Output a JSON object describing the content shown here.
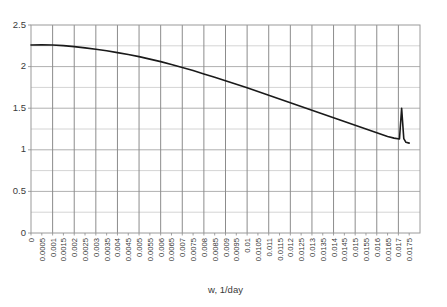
{
  "chart_data": {
    "type": "line",
    "title": "",
    "xlabel": "w, 1/day",
    "ylabel": "",
    "grid": true,
    "legend": "none",
    "xlim": [
      0,
      0.018
    ],
    "ylim": [
      0,
      2.5
    ],
    "y_ticks": [
      "0",
      "0.5",
      "1",
      "1.5",
      "2",
      "2.5"
    ],
    "y_tick_values": [
      0,
      0.5,
      1,
      1.5,
      2,
      2.5
    ],
    "x_ticks": [
      "0",
      "0.0005",
      "0.001",
      "0.0015",
      "0.002",
      "0.0025",
      "0.003",
      "0.0035",
      "0.004",
      "0.0045",
      "0.005",
      "0.0055",
      "0.006",
      "0.0065",
      "0.007",
      "0.0075",
      "0.008",
      "0.0085",
      "0.009",
      "0.0095",
      "0.01",
      "0.0105",
      "0.011",
      "0.0115",
      "0.012",
      "0.0125",
      "0.013",
      "0.0135",
      "0.014",
      "0.0145",
      "0.015",
      "0.0155",
      "0.016",
      "0.0165",
      "0.017",
      "0.0175"
    ],
    "x_tick_values": [
      0,
      0.0005,
      0.001,
      0.0015,
      0.002,
      0.0025,
      0.003,
      0.0035,
      0.004,
      0.0045,
      0.005,
      0.0055,
      0.006,
      0.0065,
      0.007,
      0.0075,
      0.008,
      0.0085,
      0.009,
      0.0095,
      0.01,
      0.0105,
      0.011,
      0.0115,
      0.012,
      0.0125,
      0.013,
      0.0135,
      0.014,
      0.0145,
      0.015,
      0.0155,
      0.016,
      0.0165,
      0.017,
      0.0175
    ],
    "gridline_x_values": [
      0,
      0.001,
      0.002,
      0.003,
      0.004,
      0.005,
      0.006,
      0.007,
      0.008,
      0.009,
      0.01,
      0.011,
      0.012,
      0.013,
      0.014,
      0.015,
      0.016,
      0.017,
      0.018
    ],
    "gridline_y_values": [
      0,
      0.5,
      1,
      1.5,
      2,
      2.5
    ],
    "series": [
      {
        "name": "curve",
        "color": "#1a1a1a",
        "x": [
          0,
          0.0005,
          0.001,
          0.0015,
          0.002,
          0.0025,
          0.003,
          0.0035,
          0.004,
          0.0045,
          0.005,
          0.0055,
          0.006,
          0.0065,
          0.007,
          0.0075,
          0.008,
          0.0085,
          0.009,
          0.0095,
          0.01,
          0.0105,
          0.011,
          0.0115,
          0.012,
          0.0125,
          0.013,
          0.0135,
          0.014,
          0.0145,
          0.015,
          0.0155,
          0.016,
          0.0165,
          0.0168,
          0.01705,
          0.01715,
          0.01725,
          0.01735,
          0.0175
        ],
        "values": [
          2.26,
          2.262,
          2.26,
          2.252,
          2.24,
          2.225,
          2.208,
          2.19,
          2.168,
          2.145,
          2.12,
          2.09,
          2.06,
          2.025,
          1.99,
          1.952,
          1.912,
          1.872,
          1.83,
          1.788,
          1.745,
          1.7,
          1.655,
          1.61,
          1.565,
          1.52,
          1.475,
          1.43,
          1.385,
          1.34,
          1.295,
          1.25,
          1.205,
          1.16,
          1.14,
          1.13,
          1.5,
          1.135,
          1.09,
          1.08
        ]
      }
    ]
  },
  "plot": {
    "left": 31,
    "right": 420,
    "top": 25,
    "bottom": 233,
    "border_color": "#9a9a9a",
    "grid_color": "#8c8c8c",
    "minor_grid_color": "#d4d4d4",
    "background": "#ffffff"
  }
}
